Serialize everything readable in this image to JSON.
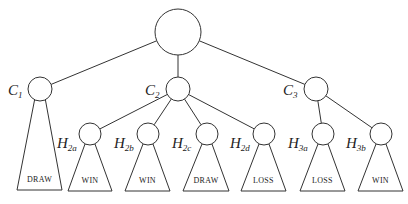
{
  "diagram": {
    "type": "game-tree",
    "root": {
      "id": "root",
      "x": 178,
      "y": 32,
      "r": 23
    },
    "children": [
      {
        "id": "C1",
        "label": "C",
        "sub": "1",
        "x": 40,
        "y": 89,
        "r": 12,
        "label_x": 8,
        "label_y": 95,
        "subtree": {
          "outcome": "DRAW",
          "base_left": 17,
          "base_right": 62,
          "base_y": 190
        }
      },
      {
        "id": "C2",
        "label": "C",
        "sub": "2",
        "x": 178,
        "y": 89,
        "r": 12,
        "label_x": 145,
        "label_y": 95
      },
      {
        "id": "C3",
        "label": "C",
        "sub": "3",
        "x": 316,
        "y": 89,
        "r": 12,
        "label_x": 283,
        "label_y": 95
      }
    ],
    "grandchildren": [
      {
        "id": "H2a",
        "parent": "C2",
        "label": "H",
        "sub": "2a",
        "x": 90,
        "y": 134,
        "r": 11,
        "label_x": 57,
        "label_y": 148,
        "outcome": "WIN",
        "base_left": 68,
        "base_right": 112,
        "base_y": 191
      },
      {
        "id": "H2b",
        "parent": "C2",
        "label": "H",
        "sub": "2b",
        "x": 148,
        "y": 134,
        "r": 11,
        "label_x": 114,
        "label_y": 148,
        "outcome": "WIN",
        "base_left": 125,
        "base_right": 170,
        "base_y": 191
      },
      {
        "id": "H2c",
        "parent": "C2",
        "label": "H",
        "sub": "2c",
        "x": 207,
        "y": 134,
        "r": 11,
        "label_x": 172,
        "label_y": 148,
        "outcome": "DRAW",
        "base_left": 183,
        "base_right": 229,
        "base_y": 191
      },
      {
        "id": "H2d",
        "parent": "C2",
        "label": "H",
        "sub": "2d",
        "x": 264,
        "y": 134,
        "r": 11,
        "label_x": 230,
        "label_y": 148,
        "outcome": "LOSS",
        "base_left": 241,
        "base_right": 286,
        "base_y": 191
      },
      {
        "id": "H3a",
        "parent": "C3",
        "label": "H",
        "sub": "3a",
        "x": 323,
        "y": 134,
        "r": 11,
        "label_x": 288,
        "label_y": 148,
        "outcome": "LOSS",
        "base_left": 300,
        "base_right": 345,
        "base_y": 191
      },
      {
        "id": "H3b",
        "parent": "C3",
        "label": "H",
        "sub": "3b",
        "x": 381,
        "y": 134,
        "r": 11,
        "label_x": 346,
        "label_y": 148,
        "outcome": "WIN",
        "base_left": 358,
        "base_right": 403,
        "base_y": 191
      }
    ],
    "stroke_color": "#333333"
  }
}
